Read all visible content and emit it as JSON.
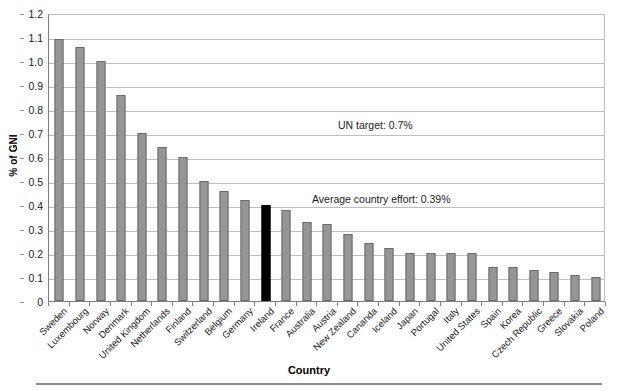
{
  "chart_data": {
    "type": "bar",
    "title": "",
    "xlabel": "Country",
    "ylabel": "% of GNI",
    "ylim": [
      0,
      1.2
    ],
    "ytick_step": 0.1,
    "yticks": [
      "1.2",
      "1.1",
      "1.0",
      "0.9",
      "0.8",
      "0.7",
      "0.6",
      "0.5",
      "0.4",
      "0.3",
      "0.2",
      "0.1",
      "0"
    ],
    "grid": true,
    "legend": "none",
    "bar_color": "#969696",
    "highlight_color": "#000000",
    "highlight_category": "Ireland",
    "categories": [
      "Sweden",
      "Luxembourg",
      "Norway",
      "Denmark",
      "United Kingdom",
      "Netherlands",
      "Finland",
      "Switzerland",
      "Belgium",
      "Germany",
      "Ireland",
      "France",
      "Australia",
      "Austria",
      "New Zealand",
      "Cananda",
      "Iceland",
      "Japan",
      "Portugal",
      "Italy",
      "United States",
      "Spain",
      "Korea",
      "Czech Republic",
      "Greece",
      "Slovakia",
      "Poland"
    ],
    "values": [
      1.09,
      1.06,
      1.0,
      0.86,
      0.7,
      0.64,
      0.6,
      0.5,
      0.46,
      0.42,
      0.4,
      0.38,
      0.33,
      0.32,
      0.28,
      0.24,
      0.22,
      0.2,
      0.2,
      0.2,
      0.2,
      0.14,
      0.14,
      0.13,
      0.12,
      0.11,
      0.1
    ],
    "annotations": [
      {
        "name": "un-target",
        "text": "UN target: 0.7%",
        "value": 0.7
      },
      {
        "name": "average-country-effort",
        "text": "Average country effort: 0.39%",
        "value": 0.39
      }
    ]
  }
}
